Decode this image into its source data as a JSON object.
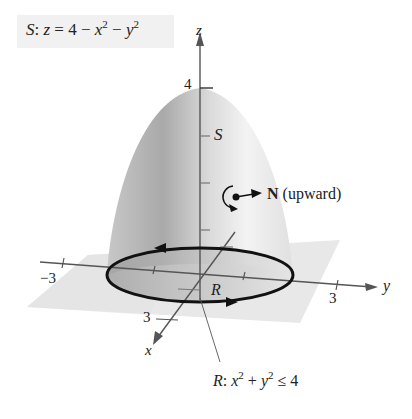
{
  "figure": {
    "surface_caption": {
      "prefix": "S",
      "colon": ":",
      "equation_lhs": "z",
      "equals": "=",
      "rhs_const": "4",
      "minus1": "−",
      "term1_var": "x",
      "term1_exp": "2",
      "minus2": "−",
      "term2_var": "y",
      "term2_exp": "2"
    },
    "axes": {
      "z": {
        "label": "z",
        "tick_label": "4"
      },
      "y": {
        "label": "y",
        "tick_pos": "3",
        "tick_neg": "−3"
      },
      "x": {
        "label": "x",
        "tick": "3"
      }
    },
    "surface_label": "S",
    "normal_label": {
      "bold": "N",
      "text": "(upward)"
    },
    "region_label": "R",
    "region_caption": {
      "prefix": "R",
      "colon": ":",
      "v1": "x",
      "e1": "2",
      "plus": "+",
      "v2": "y",
      "e2": "2",
      "rel": "≤",
      "rhs": "4"
    },
    "colors": {
      "surface_light": "#eeeeee",
      "surface_dark": "#9a9a9a",
      "plane": "#e6e6e6",
      "axis": "#555555",
      "curve": "#111111"
    }
  }
}
